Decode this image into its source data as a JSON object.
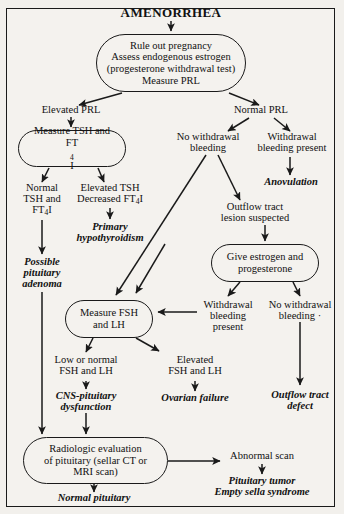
{
  "chart_title": "AMENORRHEA",
  "diagram": {
    "type": "clinical-algorithm-flowchart",
    "title": "AMENORRHEA",
    "nodes": {
      "title": "AMENORRHEA",
      "initial_workup": {
        "line1": "Rule out pregnancy",
        "line2": "Assess endogenous estrogen",
        "line3": "(progesterone withdrawal test)",
        "line4": "Measure PRL"
      },
      "elevated_prl": "Elevated PRL",
      "normal_prl": "Normal PRL",
      "measure_tsh": {
        "line1": "Measure TSH and",
        "line2_pre": "FT",
        "line2_sub": "4",
        "line2_post": "I"
      },
      "normal_tsh": {
        "line1": "Normal",
        "line2": "TSH and",
        "line3_pre": "FT",
        "line3_sub": "4",
        "line3_post": "I"
      },
      "elevated_tsh": {
        "line1": "Elevated TSH",
        "line2_pre": "Decreased FT",
        "line2_sub": "4",
        "line2_post": "I"
      },
      "primary_hypothyroidism": {
        "line1": "Primary",
        "line2": "hypothyroidism"
      },
      "possible_pituitary_adenoma": {
        "line1": "Possible",
        "line2": "pituitary",
        "line3": "adenoma"
      },
      "no_withdrawal_bleeding_1": {
        "line1": "No withdrawal",
        "line2": "bleeding"
      },
      "withdrawal_bleeding_present_1": {
        "line1": "Withdrawal",
        "line2": "bleeding present"
      },
      "anovulation": "Anovulation",
      "outflow_tract_lesion": {
        "line1": "Outflow tract",
        "line2": "lesion suspected"
      },
      "give_estrogen": {
        "line1": "Give estrogen and",
        "line2": "progesterone"
      },
      "withdrawal_bleeding_present_2": {
        "line1": "Withdrawal",
        "line2": "bleeding",
        "line3": "present"
      },
      "no_withdrawal_bleeding_2": {
        "line1": "No withdrawal",
        "line2": "bleeding  ·"
      },
      "measure_fsh_lh": {
        "line1": "Measure FSH",
        "line2": "and LH"
      },
      "low_or_normal_fsh_lh": {
        "line1": "Low or normal",
        "line2": "FSH and LH"
      },
      "elevated_fsh_lh": {
        "line1": "Elevated",
        "line2": "FSH and LH"
      },
      "cns_pituitary_dysfunction": {
        "line1": "CNS-pituitary",
        "line2": "dysfunction"
      },
      "ovarian_failure": "Ovarian failure",
      "outflow_tract_defect": {
        "line1": "Outflow tract",
        "line2": "defect"
      },
      "radiologic_evaluation": {
        "line1": "Radiologic evaluation",
        "line2": "of pituitary (sellar CT or",
        "line3": "MRI scan)"
      },
      "normal_pituitary": "Normal pituitary",
      "abnormal_scan": "Abnormal scan",
      "pituitary_tumor": {
        "line1": "Pituitary tumor",
        "line2": "Empty sella syndrome"
      }
    },
    "colors": {
      "ink": "#1a1a1a",
      "paper": "#f4f2ee"
    }
  }
}
